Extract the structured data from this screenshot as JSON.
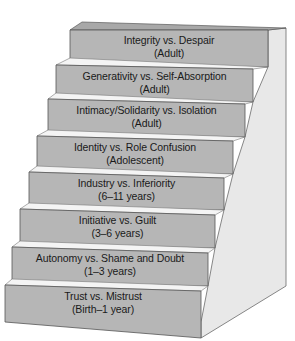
{
  "diagram": {
    "type": "staircase",
    "colors": {
      "riser": "#b4b4b4",
      "tread": "#f2f2f2",
      "side": "#e6e6e6",
      "edge": "#5a5a5a",
      "text": "#1a1a1a"
    },
    "steps": [
      {
        "title": "Integrity vs. Despair",
        "age": "(Adult)"
      },
      {
        "title": "Generativity vs. Self-Absorption",
        "age": "(Adult)"
      },
      {
        "title": "Intimacy/Solidarity vs. Isolation",
        "age": "(Adult)"
      },
      {
        "title": "Identity vs. Role Confusion",
        "age": "(Adolescent)"
      },
      {
        "title": "Industry vs. Inferiority",
        "age": "(6–11 years)"
      },
      {
        "title": "Initiative vs. Guilt",
        "age": "(3–6 years)"
      },
      {
        "title": "Autonomy vs. Shame and Doubt",
        "age": "(1–3 years)"
      },
      {
        "title": "Trust vs. Mistrust",
        "age": "(Birth–1 year)"
      }
    ]
  }
}
